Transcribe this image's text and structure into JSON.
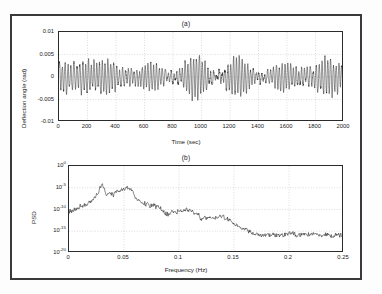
{
  "figure": {
    "background": "#ffffff",
    "frame_color": "#3a3a3a",
    "line_color": "#101010",
    "grid_color": "#b8b8b8"
  },
  "chart_data": [
    {
      "type": "line",
      "panel": "a",
      "title": "(a)",
      "xlabel": "Time (sec)",
      "ylabel": "Deflection angle (rad)",
      "xlim": [
        0,
        2000
      ],
      "ylim": [
        -0.01,
        0.01
      ],
      "xticks": [
        0,
        200,
        400,
        600,
        800,
        1000,
        1200,
        1400,
        1600,
        1800,
        2000
      ],
      "xticklabels": [
        "0",
        "200",
        "400",
        "600",
        "800",
        "1000",
        "1200",
        "1400",
        "1600",
        "1800",
        "2000"
      ],
      "yticks": [
        -0.01,
        -0.005,
        0,
        0.005,
        0.01
      ],
      "yticklabels": [
        "-0.01",
        "-0.005",
        "0",
        "0.005",
        "0.01"
      ],
      "grid": true,
      "description": "Densely oscillating deflection-angle time history, zero mean, peak amplitude about 0.005 rad, dominant period near 20 seconds with slow amplitude modulation.",
      "signal": {
        "n_points": 2600,
        "amplitude": 0.0047,
        "components": [
          {
            "freq": 0.05,
            "amp": 1.0,
            "phase": 0.0
          },
          {
            "freq": 0.053,
            "amp": 0.42,
            "phase": 1.1
          },
          {
            "freq": 0.0465,
            "amp": 0.36,
            "phase": 2.4
          },
          {
            "freq": 0.0295,
            "amp": 0.22,
            "phase": 0.7
          },
          {
            "freq": 0.105,
            "amp": 0.1,
            "phase": 3.0
          },
          {
            "freq": 0.008,
            "amp": 0.12,
            "phase": 1.8
          }
        ],
        "noise": 0.055,
        "seed": 20731
      }
    },
    {
      "type": "line",
      "panel": "b",
      "title": "(b)",
      "xlabel": "Frequency (Hz)",
      "ylabel": "PSD",
      "yscale": "log",
      "xlim": [
        0,
        0.25
      ],
      "ylim_exp": [
        -20,
        0
      ],
      "xticks": [
        0,
        0.05,
        0.1,
        0.15,
        0.2,
        0.25
      ],
      "xticklabels": [
        "0",
        "0.05",
        "0.1",
        "0.15",
        "0.2",
        "0.25"
      ],
      "ytick_exps": [
        0,
        -5,
        -10,
        -15,
        -20
      ],
      "yticklabels": [
        "10",
        "10",
        "10",
        "10",
        "10"
      ],
      "ytick_exponents": [
        "0",
        "-5",
        "-10",
        "-15",
        "-20"
      ],
      "grid": true,
      "description": "Power spectral density of the deflection angle. Broadband floor near 1e-10 at low frequency rising to a sharp peak of about 1e-4 at 0.03 Hz and a broad hump near 0.05 Hz, then monotonic roll-off to a flat noise floor of roughly 1e-16 beyond 0.17 Hz.",
      "envelope": {
        "x": [
          0.0,
          0.005,
          0.012,
          0.02,
          0.026,
          0.03,
          0.034,
          0.04,
          0.046,
          0.052,
          0.057,
          0.062,
          0.068,
          0.075,
          0.082,
          0.088,
          0.095,
          0.102,
          0.108,
          0.115,
          0.122,
          0.13,
          0.138,
          0.145,
          0.152,
          0.16,
          0.168,
          0.178,
          0.19,
          0.205,
          0.22,
          0.235,
          0.25
        ],
        "log10_psd": [
          -10.3,
          -10.0,
          -9.2,
          -8.2,
          -6.6,
          -4.3,
          -6.3,
          -6.6,
          -5.6,
          -4.9,
          -5.4,
          -7.6,
          -8.6,
          -9.2,
          -9.6,
          -11.3,
          -10.6,
          -10.2,
          -10.1,
          -10.9,
          -12.2,
          -12.0,
          -11.8,
          -12.6,
          -13.6,
          -14.6,
          -15.4,
          -15.8,
          -15.9,
          -15.8,
          -15.7,
          -15.9,
          -16.1
        ],
        "n_points": 520,
        "jitter": 0.62,
        "seed": 4817
      }
    }
  ]
}
